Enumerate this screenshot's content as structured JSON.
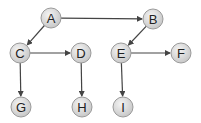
{
  "diagram": {
    "type": "directed-graph",
    "colors": {
      "edge": "#444444",
      "node_fill_light": "#f4f4f4",
      "node_fill_dark": "#c8c8c8",
      "node_stroke": "#9a9a9a",
      "label": "#222222"
    },
    "node_radius": 10,
    "nodes": [
      {
        "id": "A",
        "label": "A",
        "x": 51,
        "y": 18
      },
      {
        "id": "B",
        "label": "B",
        "x": 153,
        "y": 19
      },
      {
        "id": "C",
        "label": "C",
        "x": 20,
        "y": 53
      },
      {
        "id": "D",
        "label": "D",
        "x": 81,
        "y": 53
      },
      {
        "id": "E",
        "label": "E",
        "x": 121,
        "y": 53
      },
      {
        "id": "F",
        "label": "F",
        "x": 181,
        "y": 53
      },
      {
        "id": "G",
        "label": "G",
        "x": 21,
        "y": 107
      },
      {
        "id": "H",
        "label": "H",
        "x": 82,
        "y": 107
      },
      {
        "id": "I",
        "label": "I",
        "x": 123,
        "y": 107
      }
    ],
    "edges": [
      {
        "from": "A",
        "to": "B"
      },
      {
        "from": "A",
        "to": "C"
      },
      {
        "from": "C",
        "to": "D"
      },
      {
        "from": "C",
        "to": "G"
      },
      {
        "from": "D",
        "to": "H"
      },
      {
        "from": "B",
        "to": "E"
      },
      {
        "from": "E",
        "to": "F"
      },
      {
        "from": "E",
        "to": "I"
      }
    ]
  }
}
